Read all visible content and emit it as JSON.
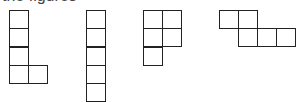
{
  "header": {
    "cropped_text": "the figures"
  },
  "shapes": [
    {
      "name": "L-shape",
      "origin": [
        9,
        10
      ],
      "cells": [
        [
          0,
          0
        ],
        [
          0,
          1
        ],
        [
          0,
          2
        ],
        [
          0,
          3
        ],
        [
          1,
          3
        ]
      ]
    },
    {
      "name": "I-shape",
      "origin": [
        86,
        10
      ],
      "cells": [
        [
          0,
          0
        ],
        [
          0,
          1
        ],
        [
          0,
          2
        ],
        [
          0,
          3
        ],
        [
          0,
          4
        ]
      ]
    },
    {
      "name": "P-shape",
      "origin": [
        143,
        10
      ],
      "cells": [
        [
          0,
          0
        ],
        [
          1,
          0
        ],
        [
          0,
          1
        ],
        [
          1,
          1
        ],
        [
          0,
          2
        ]
      ]
    },
    {
      "name": "N-shape",
      "origin": [
        219,
        10
      ],
      "cells": [
        [
          0,
          0
        ],
        [
          1,
          0
        ],
        [
          1,
          1
        ],
        [
          2,
          1
        ],
        [
          3,
          1
        ]
      ]
    }
  ],
  "cell_size": [
    19,
    18.3
  ],
  "colors": {
    "stroke": "#222222",
    "background": "#ffffff"
  }
}
